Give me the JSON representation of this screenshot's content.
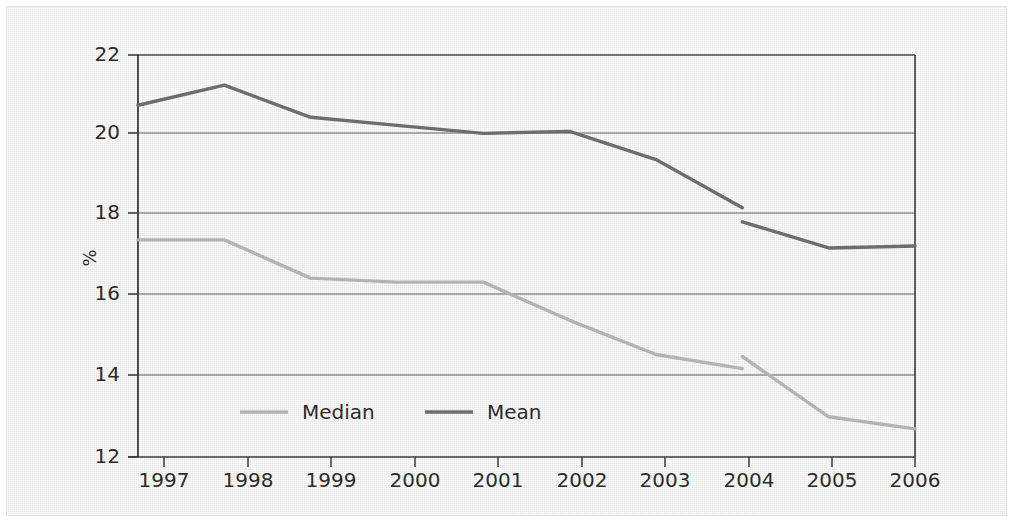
{
  "chart_data": {
    "type": "line",
    "title": "",
    "subtitle": "",
    "xlabel": "",
    "ylabel": "%",
    "categories": [
      "1997",
      "1998",
      "1999",
      "2000",
      "2001",
      "2002",
      "2003",
      "2004",
      "2005",
      "2006"
    ],
    "x": [
      1997,
      1998,
      1999,
      2000,
      2001,
      2002,
      2003,
      2004,
      2005,
      2006
    ],
    "xlim": [
      1997,
      2006
    ],
    "ylim": [
      12,
      22
    ],
    "y_ticks": [
      "12",
      "14",
      "16",
      "18",
      "20",
      "22"
    ],
    "y_tick_values": [
      12,
      14,
      16,
      18,
      20,
      22
    ],
    "grid": "horizontal",
    "legend_position": "inside-bottom-left",
    "series": [
      {
        "name": "Median",
        "color": "#b3b3b3",
        "segments": [
          {
            "x": [
              1997,
              1998,
              1999,
              2000,
              2001,
              2002,
              2003,
              2004
            ],
            "values": [
              17.4,
              17.4,
              16.45,
              16.35,
              16.35,
              15.4,
              14.55,
              14.2
            ]
          },
          {
            "x": [
              2004,
              2005,
              2006
            ],
            "values": [
              14.5,
              13.0,
              12.7
            ]
          }
        ]
      },
      {
        "name": "Mean",
        "color": "#6d6d6d",
        "segments": [
          {
            "x": [
              1997,
              1998,
              1999,
              2000,
              2001,
              2002,
              2003,
              2004
            ],
            "values": [
              20.75,
              21.25,
              20.45,
              20.25,
              20.05,
              20.1,
              19.4,
              18.2
            ]
          },
          {
            "x": [
              2004,
              2005,
              2006
            ],
            "values": [
              17.85,
              17.2,
              17.25
            ]
          }
        ]
      }
    ]
  },
  "axes": {
    "y_axis_label": "%",
    "y_ticks": [
      "22",
      "20",
      "18",
      "16",
      "14",
      "12"
    ],
    "x_ticks": [
      "1997",
      "1998",
      "1999",
      "2000",
      "2001",
      "2002",
      "2003",
      "2004",
      "2005",
      "2006"
    ]
  },
  "legend": {
    "items": [
      {
        "label": "Median",
        "color": "#b3b3b3"
      },
      {
        "label": "Mean",
        "color": "#6d6d6d"
      }
    ]
  },
  "colors": {
    "median_line": "#b3b3b3",
    "mean_line": "#6d6d6d",
    "axis": "#3a3a3a",
    "gridline": "#5a5a5a",
    "text": "#2b2b2b",
    "panel_background": "#f0f0f0"
  }
}
